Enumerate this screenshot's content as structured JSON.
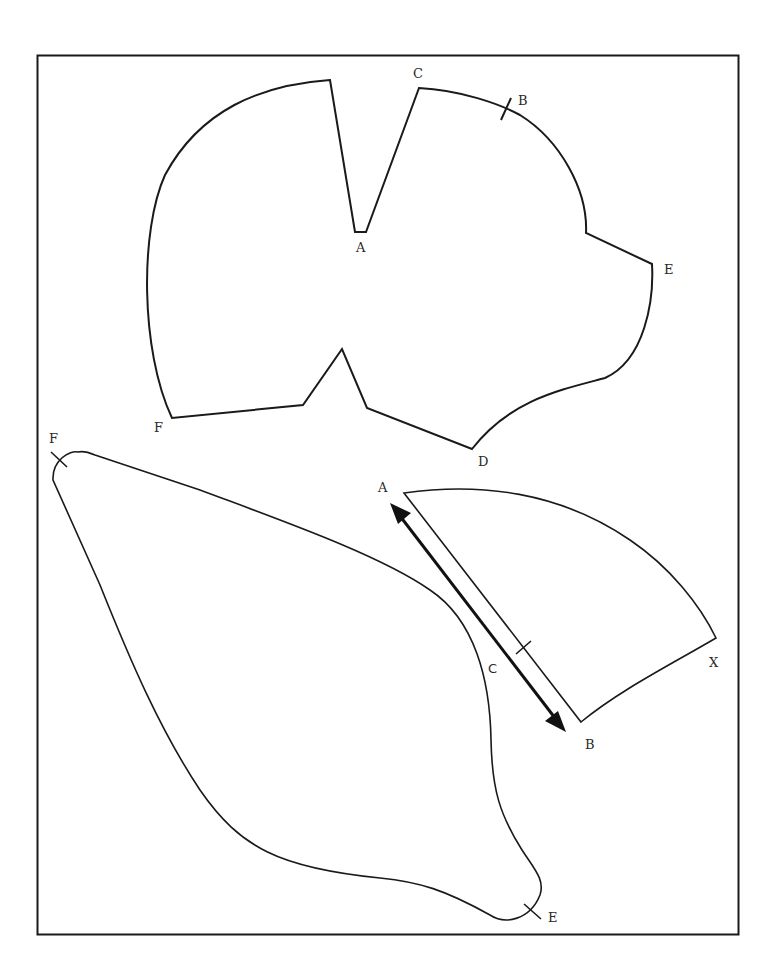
{
  "diagram": {
    "type": "sewing-pattern-pieces",
    "frame": {
      "stroke": "#1a1a1a"
    },
    "pieces": [
      {
        "name": "top-piece",
        "labels": [
          {
            "text": "C",
            "x": 413,
            "y": 67
          },
          {
            "text": "B",
            "x": 518,
            "y": 94
          },
          {
            "text": "A",
            "x": 356,
            "y": 241
          },
          {
            "text": "E",
            "x": 664,
            "y": 263
          },
          {
            "text": "F",
            "x": 154,
            "y": 421
          },
          {
            "text": "D",
            "x": 478,
            "y": 455
          }
        ]
      },
      {
        "name": "large-piece",
        "labels": [
          {
            "text": "F",
            "x": 49,
            "y": 432
          },
          {
            "text": "C",
            "x": 488,
            "y": 662
          },
          {
            "text": "E",
            "x": 548,
            "y": 911
          }
        ]
      },
      {
        "name": "quarter-piece",
        "labels": [
          {
            "text": "A",
            "x": 378,
            "y": 481
          },
          {
            "text": "X",
            "x": 709,
            "y": 656
          },
          {
            "text": "B",
            "x": 585,
            "y": 738
          }
        ]
      }
    ],
    "grainline_arrow": {
      "from": "A",
      "to": "B",
      "color": "#111111"
    }
  }
}
